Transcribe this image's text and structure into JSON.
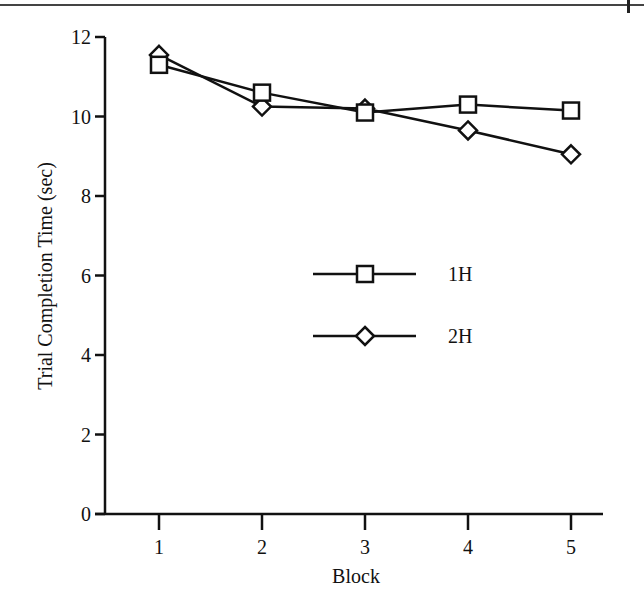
{
  "chart_data": {
    "type": "line",
    "title": "",
    "xlabel": "Block",
    "ylabel": "Trial Completion Time (sec)",
    "x": [
      1,
      2,
      3,
      4,
      5
    ],
    "categories": [
      "1",
      "2",
      "3",
      "4",
      "5"
    ],
    "ylim": [
      0,
      12
    ],
    "yticks": [
      0,
      2,
      4,
      6,
      8,
      10,
      12
    ],
    "ytick_labels": [
      "0",
      "2",
      "4",
      "6",
      "8",
      "10",
      "12"
    ],
    "grid": false,
    "legend_position": "center (inside plot)",
    "series": [
      {
        "name": "1H",
        "marker": "square",
        "values": [
          11.3,
          10.6,
          10.1,
          10.3,
          10.15
        ]
      },
      {
        "name": "2H",
        "marker": "diamond",
        "values": [
          11.55,
          10.25,
          10.2,
          9.65,
          9.05
        ]
      }
    ]
  },
  "legend": {
    "items": [
      {
        "label": "1H",
        "marker": "square"
      },
      {
        "label": "2H",
        "marker": "diamond"
      }
    ]
  },
  "colors": {
    "line": "#111111",
    "marker_fill": "#ffffff",
    "background": "#ffffff"
  }
}
